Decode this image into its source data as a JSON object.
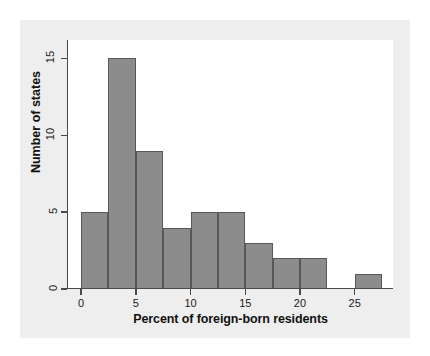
{
  "chart_data": {
    "type": "bar",
    "title": "",
    "subtitle": "",
    "xlabel": "Percent of foreign-born residents",
    "ylabel": "Number of states",
    "xlim": [
      -1.2,
      28.5
    ],
    "ylim": [
      0,
      16.2
    ],
    "grid": false,
    "legend": null,
    "bin_width": 2.5,
    "xticks": [
      0,
      5,
      10,
      15,
      20,
      25
    ],
    "xtick_labels": [
      "0",
      "5",
      "10",
      "15",
      "20",
      "25"
    ],
    "yticks": [
      0,
      5,
      10,
      15
    ],
    "ytick_labels": [
      "0",
      "5",
      "10",
      "15"
    ],
    "bin_edges": [
      0,
      2.5,
      5,
      7.5,
      10,
      12.5,
      15,
      17.5,
      20,
      22.5,
      25,
      27.5
    ],
    "categories": [
      "0-2.5",
      "2.5-5",
      "5-7.5",
      "7.5-10",
      "10-12.5",
      "12.5-15",
      "15-17.5",
      "17.5-20",
      "20-22.5",
      "22.5-25",
      "25-27.5"
    ],
    "values": [
      5,
      15,
      9,
      4,
      5,
      5,
      3,
      2,
      2,
      0,
      1
    ],
    "bar_fill_color": "#8c8c8c",
    "bar_edge_color": "#58585a",
    "plot_background": "#ffffff",
    "panel_background": "#eeeeee",
    "axis_color": "#4a4a4a"
  },
  "figure": {
    "x_axis_title": "Percent of foreign-born residents",
    "y_axis_title": "Number of states"
  }
}
